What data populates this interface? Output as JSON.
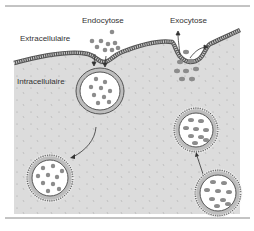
{
  "figure": {
    "title_labels": {
      "endocytosis": "Endocytose",
      "exocytosis": "Exocytose"
    },
    "region_labels": {
      "extracellular": "Extracellulaire",
      "intracellular": "Intracellulaire"
    },
    "colors": {
      "cytoplasm": "#dcdcdc",
      "membrane_outline": "#555555",
      "membrane_fill": "#bdbdbd",
      "vesicle_interior": "#ffffff",
      "particle": "#8c8c8c",
      "rule_line": "#888888"
    }
  }
}
